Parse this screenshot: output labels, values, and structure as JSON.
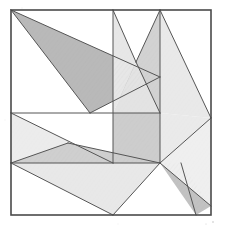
{
  "figure": {
    "medium": "pencil line drawing with graphite shading",
    "background_color": "#ffffff",
    "line_color": "#3b3b3b",
    "frame": {
      "name": "outer-square",
      "top_left": [
        11,
        10
      ],
      "top_right": [
        211,
        10
      ],
      "bottom_right": [
        211,
        215
      ],
      "bottom_left": [
        11,
        215
      ],
      "stroke": "#4a4a4a",
      "stroke_width": 1.6
    },
    "vertices": {
      "TL": [
        11,
        10
      ],
      "TR": [
        211,
        10
      ],
      "BR": [
        211,
        215
      ],
      "BL": [
        11,
        215
      ],
      "T_a": [
        113,
        10
      ],
      "T_b": [
        160,
        10
      ],
      "L_mid": [
        11,
        113
      ],
      "L_low": [
        11,
        163
      ],
      "R_mid": [
        211,
        118
      ],
      "B_mid": [
        113,
        215
      ],
      "V_apex": [
        136,
        62
      ],
      "X_left": [
        68,
        143
      ],
      "C_a": [
        113,
        113
      ],
      "C_b": [
        160,
        113
      ],
      "C_c": [
        160,
        163
      ],
      "C_d": [
        113,
        163
      ],
      "TL_ray_end": [
        160,
        77
      ],
      "W_notch": [
        90,
        113
      ]
    },
    "shapes": [
      {
        "id": "shape-1",
        "name": "dark-wedge-top-left",
        "points": "11,10 160,77 90,113",
        "fill": "#b9b9b9",
        "tone": "dark",
        "note": "large shaded wedge anchored at top-left corner"
      },
      {
        "id": "shape-2",
        "name": "light-triangle-upper-middle",
        "points": "113,10 136,62 113,113",
        "fill": "#e7e7e7",
        "tone": "light"
      },
      {
        "id": "shape-3",
        "name": "light-strip-left-of-v",
        "points": "113,113 136,62 160,113",
        "fill": "#e3e3e3",
        "tone": "light"
      },
      {
        "id": "shape-4",
        "name": "mid-triangle-right-of-v",
        "points": "160,10 136,62 160,113",
        "fill": "#d2d2d2",
        "tone": "medium"
      },
      {
        "id": "shape-5",
        "name": "light-triangle-top-right",
        "points": "160,10 211,118 160,113",
        "fill": "#e9e9e9",
        "tone": "light"
      },
      {
        "id": "shape-6",
        "name": "light-band-left-middle",
        "points": "11,113 113,163 11,163",
        "fill": "#ececec",
        "tone": "light"
      },
      {
        "id": "shape-7",
        "name": "shaded-triangle-center-left",
        "points": "68,143 160,163 11,163",
        "fill": "#cfcfcf",
        "tone": "medium"
      },
      {
        "id": "shape-8",
        "name": "shaded-square-center",
        "points": "113,113 160,113 160,163 113,163",
        "fill": "#cdcdcd",
        "tone": "medium"
      },
      {
        "id": "shape-9",
        "name": "light-triangle-right-middle",
        "points": "160,113 211,118 160,163",
        "fill": "#eaeaea",
        "tone": "light"
      },
      {
        "id": "shape-10",
        "name": "large-triangle-bottom",
        "points": "11,163 160,163 113,215",
        "fill": "#e8e8e8",
        "tone": "light"
      },
      {
        "id": "shape-11",
        "name": "dark-diagonal-bar-bottom-right",
        "points": "160,163 181,163 211,206 196,215",
        "fill": "#c2c2c2",
        "tone": "dark"
      },
      {
        "id": "shape-12",
        "name": "light-triangle-bottom-right-corner",
        "points": "160,163 211,118 211,206",
        "fill": "#efefef",
        "tone": "light"
      }
    ],
    "lines": [
      {
        "name": "edge-topleft-to-ray",
        "from": [
          11,
          10
        ],
        "to": [
          160,
          77
        ]
      },
      {
        "name": "edge-topleft-to-notch",
        "from": [
          11,
          10
        ],
        "to": [
          90,
          113
        ]
      },
      {
        "name": "edge-ray-to-notch",
        "from": [
          160,
          77
        ],
        "to": [
          90,
          113
        ]
      },
      {
        "name": "vertical-divider-upper",
        "from": [
          113,
          10
        ],
        "to": [
          113,
          163
        ]
      },
      {
        "name": "v-left-stroke",
        "from": [
          113,
          10
        ],
        "to": [
          136,
          62
        ]
      },
      {
        "name": "v-right-stroke",
        "from": [
          160,
          10
        ],
        "to": [
          136,
          62
        ]
      },
      {
        "name": "v-apex-down-stroke",
        "from": [
          136,
          62
        ],
        "to": [
          160,
          113
        ]
      },
      {
        "name": "vertical-divider-right",
        "from": [
          160,
          10
        ],
        "to": [
          160,
          163
        ]
      },
      {
        "name": "long-diagonal-to-right-edge",
        "from": [
          160,
          10
        ],
        "to": [
          211,
          118
        ]
      },
      {
        "name": "horizontal-divider-upper",
        "from": [
          11,
          113
        ],
        "to": [
          160,
          113
        ]
      },
      {
        "name": "horizontal-divider-lower",
        "from": [
          11,
          163
        ],
        "to": [
          160,
          163
        ]
      },
      {
        "name": "diagonal-left-to-center",
        "from": [
          11,
          113
        ],
        "to": [
          113,
          163
        ]
      },
      {
        "name": "diagonal-lowleft-to-notch",
        "from": [
          11,
          163
        ],
        "to": [
          68,
          143
        ]
      },
      {
        "name": "diagonal-notch-to-center",
        "from": [
          68,
          143
        ],
        "to": [
          160,
          163
        ]
      },
      {
        "name": "bottom-triangle-left-edge",
        "from": [
          11,
          163
        ],
        "to": [
          113,
          215
        ]
      },
      {
        "name": "bottom-triangle-right-edge",
        "from": [
          113,
          215
        ],
        "to": [
          160,
          163
        ]
      },
      {
        "name": "right-edge-vertex-to-center",
        "from": [
          211,
          118
        ],
        "to": [
          160,
          163
        ]
      },
      {
        "name": "bar-upper-edge",
        "from": [
          160,
          163
        ],
        "to": [
          211,
          206
        ]
      },
      {
        "name": "bar-lower-edge",
        "from": [
          181,
          163
        ],
        "to": [
          196,
          215
        ]
      }
    ]
  }
}
